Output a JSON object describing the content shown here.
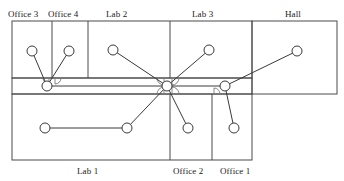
{
  "diagram": {
    "canvas": {
      "width": 344,
      "height": 181
    },
    "colors": {
      "wall": "#4a4a4a",
      "node_stroke": "#3a3a3a",
      "node_fill": "#ffffff",
      "edge": "#3a3a3a",
      "door_arc": "#7a7a7a",
      "label_text": "#1a1a1a",
      "background": "#ffffff"
    },
    "rooms": [
      {
        "id": "office-3",
        "label": "Office 3",
        "label_x": 8,
        "label_y": 9,
        "label_pos": "top"
      },
      {
        "id": "office-4",
        "label": "Office 4",
        "label_x": 48,
        "label_y": 9,
        "label_pos": "top"
      },
      {
        "id": "lab-2",
        "label": "Lab 2",
        "label_x": 106,
        "label_y": 9,
        "label_pos": "top"
      },
      {
        "id": "lab-3",
        "label": "Lab 3",
        "label_x": 192,
        "label_y": 9,
        "label_pos": "top"
      },
      {
        "id": "hall",
        "label": "Hall",
        "label_x": 285,
        "label_y": 9,
        "label_pos": "top"
      },
      {
        "id": "lab-1",
        "label": "Lab 1",
        "label_x": 77,
        "label_y": 166,
        "label_pos": "bottom"
      },
      {
        "id": "office-2",
        "label": "Office 2",
        "label_x": 173,
        "label_y": 166,
        "label_pos": "bottom"
      },
      {
        "id": "office-1",
        "label": "Office 1",
        "label_x": 220,
        "label_y": 166,
        "label_pos": "bottom"
      }
    ],
    "walls": [
      {
        "id": "upper-block-outline",
        "type": "rect",
        "x": 12,
        "y": 21,
        "w": 240,
        "h": 57
      },
      {
        "id": "hall-outline",
        "type": "rect",
        "x": 252,
        "y": 21,
        "w": 85,
        "h": 73
      },
      {
        "id": "corridor-outline",
        "type": "rect",
        "x": 12,
        "y": 78,
        "w": 240,
        "h": 16
      },
      {
        "id": "lower-block-outline",
        "type": "rect",
        "x": 12,
        "y": 94,
        "w": 240,
        "h": 66
      },
      {
        "id": "div-office3-office4",
        "type": "line",
        "x1": 52,
        "y1": 21,
        "x2": 52,
        "y2": 78
      },
      {
        "id": "div-office4-lab2",
        "type": "line",
        "x1": 88,
        "y1": 21,
        "x2": 88,
        "y2": 78
      },
      {
        "id": "div-lab2-lab3",
        "type": "line",
        "x1": 170,
        "y1": 21,
        "x2": 170,
        "y2": 78
      },
      {
        "id": "div-lab1-office2",
        "type": "line",
        "x1": 170,
        "y1": 94,
        "x2": 170,
        "y2": 160
      },
      {
        "id": "div-office2-office1",
        "type": "line",
        "x1": 212,
        "y1": 94,
        "x2": 212,
        "y2": 160
      }
    ],
    "doors": [
      {
        "id": "door-office3",
        "cx": 49,
        "cy": 78,
        "r": 6,
        "facing": "down-left"
      },
      {
        "id": "door-office4",
        "cx": 55,
        "cy": 78,
        "r": 6,
        "facing": "down-right"
      },
      {
        "id": "door-lab2",
        "cx": 164,
        "cy": 78,
        "r": 7,
        "facing": "down-left"
      },
      {
        "id": "door-lab3",
        "cx": 172,
        "cy": 78,
        "r": 7,
        "facing": "down-right"
      },
      {
        "id": "door-lab1",
        "cx": 164,
        "cy": 94,
        "r": 7,
        "facing": "up-left"
      },
      {
        "id": "door-office2",
        "cx": 172,
        "cy": 94,
        "r": 7,
        "facing": "up-right"
      },
      {
        "id": "door-office1",
        "cx": 214,
        "cy": 94,
        "r": 6,
        "facing": "up-right"
      }
    ],
    "nodes": [
      {
        "id": "n-office3",
        "room": "Office 3",
        "x": 32,
        "y": 51,
        "r": 5
      },
      {
        "id": "n-office4",
        "room": "Office 4",
        "x": 69,
        "y": 51,
        "r": 5
      },
      {
        "id": "n-lab2",
        "room": "Lab 2",
        "x": 113,
        "y": 50,
        "r": 5
      },
      {
        "id": "n-lab3",
        "room": "Lab 3",
        "x": 209,
        "y": 50,
        "r": 5
      },
      {
        "id": "n-hall",
        "room": "Hall",
        "x": 297,
        "y": 51,
        "r": 5
      },
      {
        "id": "n-corr-w",
        "room": "Corridor",
        "x": 47,
        "y": 86,
        "r": 5
      },
      {
        "id": "n-corr-c",
        "room": "Corridor",
        "x": 167,
        "y": 86,
        "r": 5
      },
      {
        "id": "n-corr-e",
        "room": "Corridor",
        "x": 225,
        "y": 86,
        "r": 5
      },
      {
        "id": "n-lab1-w",
        "room": "Lab 1",
        "x": 45,
        "y": 128,
        "r": 5
      },
      {
        "id": "n-lab1-e",
        "room": "Lab 1",
        "x": 127,
        "y": 128,
        "r": 5
      },
      {
        "id": "n-office2",
        "room": "Office 2",
        "x": 188,
        "y": 128,
        "r": 5
      },
      {
        "id": "n-office1",
        "room": "Office 1",
        "x": 234,
        "y": 128,
        "r": 5
      }
    ],
    "edges": [
      {
        "id": "e-office3-corrw",
        "from": "n-office3",
        "to": "n-corr-w"
      },
      {
        "id": "e-office4-corrw",
        "from": "n-office4",
        "to": "n-corr-w"
      },
      {
        "id": "e-corrw-corrc",
        "from": "n-corr-w",
        "to": "n-corr-c"
      },
      {
        "id": "e-lab2-corrc",
        "from": "n-lab2",
        "to": "n-corr-c"
      },
      {
        "id": "e-lab3-corrc",
        "from": "n-lab3",
        "to": "n-corr-c"
      },
      {
        "id": "e-corrc-corre",
        "from": "n-corr-c",
        "to": "n-corr-e"
      },
      {
        "id": "e-corre-hall",
        "from": "n-corr-e",
        "to": "n-hall"
      },
      {
        "id": "e-corrc-lab1e",
        "from": "n-corr-c",
        "to": "n-lab1-e"
      },
      {
        "id": "e-corrc-office2",
        "from": "n-corr-c",
        "to": "n-office2"
      },
      {
        "id": "e-corre-office1",
        "from": "n-corr-e",
        "to": "n-office1"
      },
      {
        "id": "e-lab1w-lab1e",
        "from": "n-lab1-w",
        "to": "n-lab1-e"
      }
    ]
  }
}
